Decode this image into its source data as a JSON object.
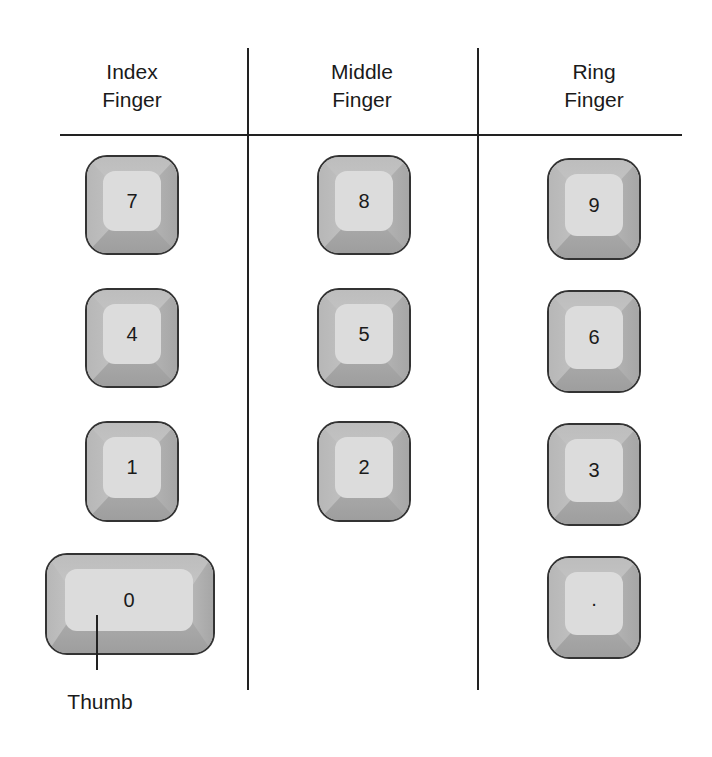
{
  "columns": [
    {
      "title_line1": "Index",
      "title_line2": "Finger"
    },
    {
      "title_line1": "Middle",
      "title_line2": "Finger"
    },
    {
      "title_line1": "Ring",
      "title_line2": "Finger"
    }
  ],
  "keys": {
    "k7": "7",
    "k4": "4",
    "k1": "1",
    "k0": "0",
    "k8": "8",
    "k5": "5",
    "k2": "2",
    "k9": "9",
    "k6": "6",
    "k3": "3",
    "kdot": "·"
  },
  "annotation": {
    "thumb_label": "Thumb"
  }
}
